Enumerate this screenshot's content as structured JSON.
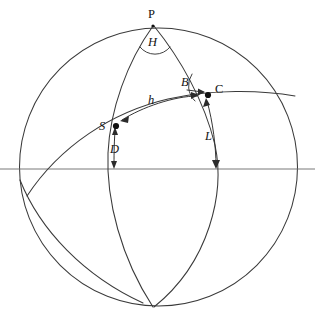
{
  "figure": {
    "type": "diagram",
    "background_color": "#ffffff",
    "line_color": "#3a3a3a"
  },
  "labels": {
    "pole": "P",
    "star": "S",
    "body": "C",
    "hour_angle": "H",
    "azimuth_angle": "B",
    "altitude_arc": "h",
    "declination_arc": "D",
    "latitude_arc": "L"
  },
  "points": [
    {
      "name": "P",
      "label": "P",
      "x": 153,
      "y": 26,
      "label_x": 148,
      "label_y": 18,
      "dotted": false
    },
    {
      "name": "S",
      "label": "S",
      "x": 116,
      "y": 126,
      "label_x": 101,
      "label_y": 128,
      "dotted": true
    },
    {
      "name": "C",
      "label": "C",
      "x": 208,
      "y": 95,
      "label_x": 215,
      "label_y": 93,
      "dotted": true
    }
  ],
  "angles": [
    {
      "name": "H",
      "label": "H",
      "vertex": "P",
      "label_x": 150,
      "label_y": 44
    },
    {
      "name": "B",
      "label": "B",
      "vertex": "C",
      "label_x": 184,
      "label_y": 84
    }
  ],
  "arc_labels": [
    {
      "name": "h",
      "label": "h",
      "x": 152,
      "y": 101,
      "describes": "arc S to C"
    },
    {
      "name": "D",
      "label": "D",
      "x": 113,
      "y": 150,
      "describes": "arc S to horizon"
    },
    {
      "name": "L",
      "label": "L",
      "x": 209,
      "y": 136,
      "describes": "arc C to horizon"
    }
  ],
  "geometry": {
    "circle": {
      "cx": 158.5,
      "cy": 167,
      "r": 139
    },
    "horizon_y": 169,
    "horizon_x1": 0,
    "horizon_x2": 315
  }
}
